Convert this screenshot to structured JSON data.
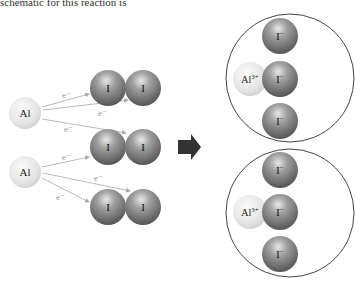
{
  "caption": "schematic for this reaction is",
  "reactants": {
    "aluminum_atoms": [
      {
        "label": "Al",
        "cx": 25,
        "cy": 113
      },
      {
        "label": "Al",
        "cx": 25,
        "cy": 172
      }
    ],
    "iodine_molecules": [
      {
        "atoms": [
          {
            "label": "I",
            "cx": 108,
            "cy": 88
          },
          {
            "label": "I",
            "cx": 143,
            "cy": 88
          }
        ]
      },
      {
        "atoms": [
          {
            "label": "I",
            "cx": 108,
            "cy": 147
          },
          {
            "label": "I",
            "cx": 143,
            "cy": 147
          }
        ]
      },
      {
        "atoms": [
          {
            "label": "I",
            "cx": 108,
            "cy": 207
          },
          {
            "label": "I",
            "cx": 143,
            "cy": 207
          }
        ]
      }
    ],
    "electron_label": "e⁻"
  },
  "arrow": {
    "direction": "right",
    "color": "#333333"
  },
  "products": [
    {
      "cation": "Al",
      "cation_charge": "3+",
      "anion": "I",
      "anion_charge": "−"
    },
    {
      "cation": "Al",
      "cation_charge": "3+",
      "anion": "I",
      "anion_charge": "−"
    }
  ],
  "colors": {
    "al_fill": "#e2e2e2",
    "i_fill": "#8a8a8a",
    "electron_arrow": "#a8a8a8",
    "circle_border": "#444444"
  }
}
